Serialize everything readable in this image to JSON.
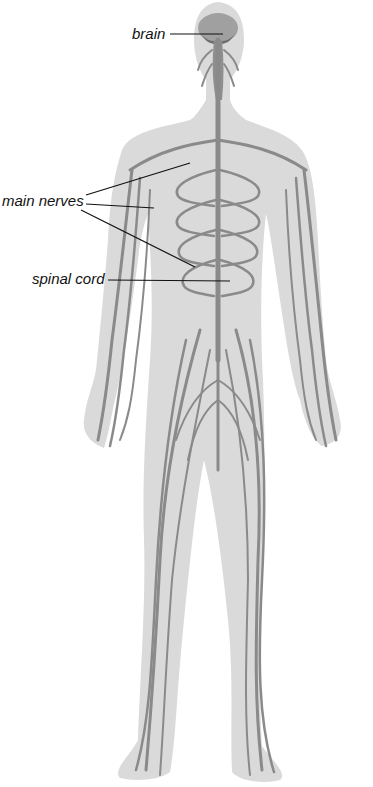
{
  "labels": {
    "brain": "brain",
    "main_nerves": "main nerves",
    "spinal_cord": "spinal cord"
  },
  "colors": {
    "body_fill": "#d9d9d9",
    "nerve": "#8a8a8a",
    "brain": "#9a9a9a",
    "leader_line": "#111111",
    "background": "#ffffff"
  }
}
